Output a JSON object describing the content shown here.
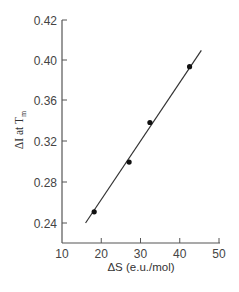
{
  "chart_data": {
    "type": "scatter",
    "title": "",
    "xlabel": "ΔS (e.u./mol)",
    "ylabel": "ΔI at T",
    "ylabel_subscript": "m",
    "x_ticks": [
      10,
      20,
      30,
      40,
      50
    ],
    "y_tick_labels": [
      "0.24",
      "0.28",
      "0.32",
      "0.36",
      "0.40",
      "0.42"
    ],
    "xlim": [
      10,
      50
    ],
    "ylim": [
      0.24,
      0.42
    ],
    "grid": false,
    "legend": null,
    "series": [
      {
        "name": "data",
        "type": "scatter",
        "x": [
          18.2,
          27.1,
          32.4,
          42.5
        ],
        "y": [
          0.251,
          0.3,
          0.339,
          0.394
        ]
      },
      {
        "name": "fit line",
        "type": "line",
        "x": [
          16.0,
          45.5
        ],
        "y": [
          0.24,
          0.41
        ]
      }
    ],
    "colors": {
      "axis": "#555555",
      "points": "#111111",
      "line": "#333333"
    }
  }
}
